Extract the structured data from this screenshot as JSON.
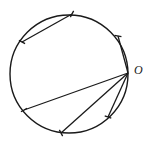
{
  "figure": {
    "kind": "geometry-diagram",
    "background_color": "#ffffff",
    "stroke_color": "#1a1a1a",
    "canvas": {
      "width": 154,
      "height": 144
    }
  },
  "circle": {
    "label": "circle",
    "center_x": 69,
    "center_y": 74,
    "radius": 59,
    "stroke_width": 1.4
  },
  "labels": [
    {
      "id": "point-o",
      "text": "O",
      "x": 134,
      "y": 64,
      "font_size": 12,
      "italic": true
    }
  ],
  "points": [
    {
      "id": "O",
      "x": 128,
      "y": 73,
      "tick": false
    },
    {
      "id": "A",
      "x": 72,
      "y": 14,
      "tick": true
    },
    {
      "id": "B",
      "x": 22,
      "y": 42,
      "tick": true
    },
    {
      "id": "C",
      "x": 24,
      "y": 110,
      "tick": true
    },
    {
      "id": "D",
      "x": 61,
      "y": 133,
      "tick": true
    },
    {
      "id": "E",
      "x": 108,
      "y": 117,
      "tick": true
    },
    {
      "id": "F",
      "x": 118,
      "y": 36,
      "tick": true
    }
  ],
  "chords": [
    {
      "id": "chord-ab",
      "from": "A",
      "to": "B",
      "stroke_width": 1.3
    },
    {
      "id": "chord-fo",
      "from": "F",
      "to": "O",
      "stroke_width": 1.3
    },
    {
      "id": "chord-oc",
      "from": "O",
      "to": "C",
      "stroke_width": 1.3
    },
    {
      "id": "chord-od",
      "from": "O",
      "to": "D",
      "stroke_width": 1.3
    },
    {
      "id": "chord-oe",
      "from": "O",
      "to": "E",
      "stroke_width": 1.3
    }
  ],
  "ticks": [
    {
      "id": "tick-a",
      "x": 72,
      "y": 14,
      "angle": -62,
      "length": 7
    },
    {
      "id": "tick-b",
      "x": 22,
      "y": 42,
      "angle": 28,
      "length": 7
    },
    {
      "id": "tick-c",
      "x": 24,
      "y": 110,
      "angle": -30,
      "length": 7
    },
    {
      "id": "tick-d",
      "x": 61,
      "y": 133,
      "angle": 62,
      "length": 7
    },
    {
      "id": "tick-e",
      "x": 108,
      "y": 117,
      "angle": 20,
      "length": 7
    },
    {
      "id": "tick-f",
      "x": 118,
      "y": 36,
      "angle": 10,
      "length": 7
    }
  ]
}
